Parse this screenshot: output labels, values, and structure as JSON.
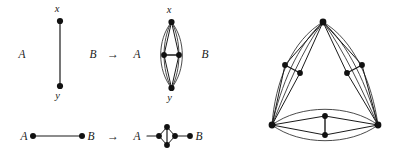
{
  "figure": {
    "name": "graph-transformation-figure",
    "background_color": "#ffffff",
    "stroke_color": "#1a1a1a",
    "node_color": "#111111",
    "panels": [
      {
        "id": "top-left-source",
        "description": "single vertical edge from x to y with side labels A and B",
        "labels": {
          "left_label": "A",
          "right_label": "B",
          "top_vertex": "x",
          "bottom_vertex": "y"
        }
      },
      {
        "id": "top-arrow",
        "description": "rightwards arrow between source and target graphs",
        "glyph": "→"
      },
      {
        "id": "top-right-target",
        "description": "lens graph: x on top, y at bottom, two middle vertices joined by a horizontal edge, outer curved arcs",
        "labels": {
          "left_label": "A",
          "right_label": "B",
          "top_vertex": "x",
          "bottom_vertex": "y"
        }
      },
      {
        "id": "bottom-left-source",
        "description": "single horizontal edge with endpoint labels A and B",
        "labels": {
          "left_label": "A",
          "right_label": "B"
        }
      },
      {
        "id": "bottom-arrow",
        "description": "rightwards arrow between source and target graphs",
        "glyph": "→"
      },
      {
        "id": "bottom-right-target",
        "description": "diamond gadget with a vertical interior edge, attached to A on the left and B on the right",
        "labels": {
          "left_label": "A",
          "right_label": "B"
        }
      },
      {
        "id": "right-composite",
        "description": "triangular multigraph with three corner vertices; each side is a lens gadget containing two interior vertices joined by an edge",
        "corner_count": 3,
        "interior_vertices_per_side": 2
      }
    ]
  },
  "labels": {
    "A": "A",
    "B": "B",
    "x": "x",
    "y": "y",
    "arrow": "→"
  }
}
